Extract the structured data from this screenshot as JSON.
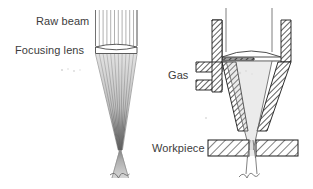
{
  "figure": {
    "background_color": "#ffffff",
    "line_color": "#000000",
    "hatch_color": "#000000",
    "text_color": "#3c3c3c",
    "beam_color": "#9a9a9a"
  },
  "labels": {
    "raw_beam": "Raw beam",
    "focusing_lens": "Focusing lens",
    "gas": "Gas",
    "workpiece": "Workpiece"
  },
  "left_diagram": {
    "name": "optics-schematic",
    "ray_count": 12,
    "ray_span_left": 95,
    "ray_span_right": 137,
    "ray_top": 10,
    "lens_top": 44,
    "lens_bottom": 56,
    "focus_x": 120,
    "focus_y": 152,
    "beam_bottom": 178
  },
  "right_diagram": {
    "name": "nozzle-assembly",
    "nozzle_left_wall_x": 212,
    "nozzle_right_wall_x": 281,
    "nozzle_top_y": 20,
    "lens_y": 55,
    "tip_y": 131,
    "workpiece_top": 140,
    "workpiece_bottom": 156,
    "workpiece_left": 208,
    "workpiece_right": 298,
    "kerf_center_x": 251,
    "gas_port_count": 2
  }
}
